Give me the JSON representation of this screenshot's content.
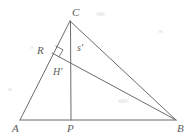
{
  "figure": {
    "type": "geometry-diagram",
    "width": 191,
    "height": 136,
    "stroke_color": "#6b6b6b",
    "background_color": "#ffffff",
    "label_color": "#5d5d5d"
  },
  "points": {
    "A": {
      "label": "A",
      "x": 20,
      "y": 120,
      "label_x": 12,
      "label_y": 123
    },
    "B": {
      "label": "B",
      "x": 176,
      "y": 120,
      "label_x": 177,
      "label_y": 123
    },
    "C": {
      "label": "C",
      "x": 70,
      "y": 21,
      "label_x": 72,
      "label_y": 7
    },
    "P": {
      "label": "P",
      "x": 71,
      "y": 120,
      "label_x": 67,
      "label_y": 123
    },
    "R": {
      "label": "R",
      "x": 52,
      "y": 53,
      "label_x": 37,
      "label_y": 45
    }
  },
  "segment_labels": {
    "s_prime": {
      "label": "s'",
      "x": 77,
      "y": 43
    },
    "H_prime": {
      "label": "H'",
      "x": 53,
      "y": 67
    }
  },
  "segments": [
    {
      "name": "side-AB",
      "from": "A",
      "to": "B"
    },
    {
      "name": "side-AC",
      "from": "A",
      "to": "C"
    },
    {
      "name": "side-CB",
      "from": "C",
      "to": "B"
    },
    {
      "name": "altitude-CP",
      "from": "C",
      "to": "P"
    },
    {
      "name": "cevian-RB",
      "from": "R",
      "to": "B"
    }
  ],
  "marks": {
    "right_angle_at_R": {
      "name": "right-angle-mark",
      "vertex_x": 52,
      "vertex_y": 53,
      "size": 8
    }
  }
}
